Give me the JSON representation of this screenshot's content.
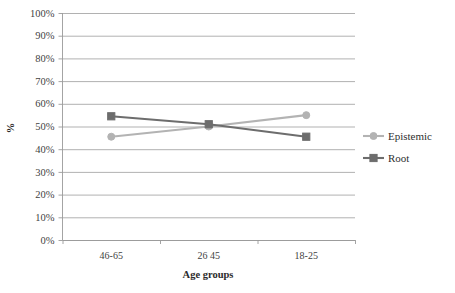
{
  "chart_data": {
    "type": "line",
    "title": "",
    "xlabel": "Age groups",
    "ylabel": "%",
    "categories": [
      "46-65",
      "26 45",
      "18-25"
    ],
    "ylim": [
      0,
      100
    ],
    "ytick_labels": [
      "0%",
      "10%",
      "20%",
      "30%",
      "40%",
      "50%",
      "60%",
      "70%",
      "80%",
      "90%",
      "100%"
    ],
    "ytick_values": [
      0,
      10,
      20,
      30,
      40,
      50,
      60,
      70,
      80,
      90,
      100
    ],
    "grid": true,
    "legend_position": "right",
    "series": [
      {
        "name": "Epistemic",
        "values": [
          45.5,
          50.0,
          55.0
        ],
        "color": "#b3b3b3",
        "marker": "circle"
      },
      {
        "name": "Root",
        "values": [
          54.5,
          51.0,
          45.5
        ],
        "color": "#6d6d6d",
        "marker": "square"
      }
    ]
  },
  "legend": {
    "items": [
      {
        "label": "Epistemic",
        "color": "#b3b3b3",
        "marker": "circle"
      },
      {
        "label": "Root",
        "color": "#6d6d6d",
        "marker": "square"
      }
    ]
  },
  "axes": {
    "y_title": "%",
    "x_title": "Age groups"
  },
  "colors": {
    "epistemic": "#b3b3b3",
    "root": "#6d6d6d",
    "grid": "#a8a8a8",
    "axis": "#9a9a9a",
    "text": "#3f3f3f",
    "background": "#ffffff"
  }
}
